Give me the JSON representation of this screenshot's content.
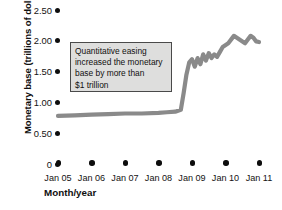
{
  "chart_data": {
    "type": "line",
    "title": "",
    "xlabel": "Month/year",
    "ylabel": "Monetary base (trillions of dollars)",
    "ylim": [
      0,
      2.5
    ],
    "ytick_labels": [
      "2.50",
      "2.00",
      "1.50",
      "1.00",
      "0.50",
      "0"
    ],
    "ytick_values": [
      2.5,
      2.0,
      1.5,
      1.0,
      0.5,
      0
    ],
    "xtick_labels": [
      "Jan 05",
      "Jan 06",
      "Jan 07",
      "Jan 08",
      "Jan 09",
      "Jan 10",
      "Jan 11"
    ],
    "grid": false,
    "legend": null,
    "series": [
      {
        "name": "Monetary base",
        "color": "#8a8a8a",
        "x": [
          "Jan 05",
          "Jul 05",
          "Jan 06",
          "Jul 06",
          "Jan 07",
          "Jul 07",
          "Jan 08",
          "Apr 08",
          "Jul 08",
          "Sep 08",
          "Oct 08",
          "Nov 08",
          "Dec 08",
          "Jan 09",
          "Feb 09",
          "Mar 09",
          "Apr 09",
          "May 09",
          "Jun 09",
          "Jul 09",
          "Aug 09",
          "Sep 09",
          "Oct 09",
          "Nov 09",
          "Dec 09",
          "Feb 10",
          "Apr 10",
          "Jun 10",
          "Aug 10",
          "Sep 10",
          "Oct 10",
          "Nov 10",
          "Dec 10",
          "Jan 11"
        ],
        "values": [
          0.78,
          0.79,
          0.8,
          0.81,
          0.82,
          0.82,
          0.83,
          0.84,
          0.85,
          0.88,
          1.15,
          1.45,
          1.65,
          1.7,
          1.58,
          1.72,
          1.62,
          1.78,
          1.68,
          1.8,
          1.72,
          1.78,
          1.74,
          1.82,
          1.9,
          1.96,
          2.08,
          2.02,
          1.96,
          2.02,
          2.08,
          2.05,
          1.99,
          1.98
        ]
      }
    ],
    "annotations": [
      {
        "id": "qe-note",
        "lines": [
          "Quantitative easing",
          "increased the monetary",
          "base by more than",
          "$1 trillion"
        ]
      }
    ]
  }
}
